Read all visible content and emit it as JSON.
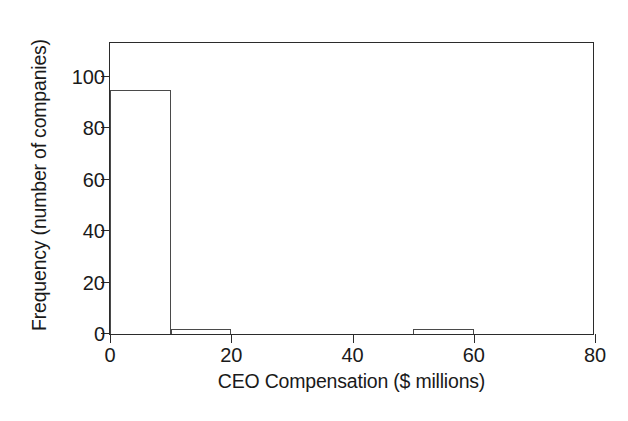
{
  "chart_data": {
    "type": "bar",
    "chart_subtype": "histogram",
    "title": "",
    "xlabel": "CEO Compensation ($ millions)",
    "ylabel": "Frequency (number of companies)",
    "xlim": [
      0,
      80
    ],
    "ylim": [
      0,
      114
    ],
    "xticks": [
      0,
      20,
      40,
      60,
      80
    ],
    "xtick_labels": [
      "0",
      "20",
      "40",
      "60",
      "80"
    ],
    "yticks": [
      0,
      20,
      40,
      60,
      80,
      100
    ],
    "ytick_labels": [
      "0",
      "20",
      "40",
      "60",
      "80",
      "100"
    ],
    "grid": false,
    "legend": null,
    "bin_width": 10,
    "bin_edges": [
      0,
      10,
      20,
      30,
      40,
      50,
      60,
      70,
      80
    ],
    "categories": [
      "0-10",
      "10-20",
      "20-30",
      "30-40",
      "40-50",
      "50-60",
      "60-70",
      "70-80"
    ],
    "values": [
      95,
      2,
      0,
      0,
      0,
      2,
      0,
      0
    ],
    "bars": [
      {
        "label": "0-10",
        "x0": 0,
        "x1": 10,
        "value": 95
      },
      {
        "label": "10-20",
        "x0": 10,
        "x1": 20,
        "value": 2
      },
      {
        "label": "20-30",
        "x0": 20,
        "x1": 30,
        "value": 0
      },
      {
        "label": "30-40",
        "x0": 30,
        "x1": 40,
        "value": 0
      },
      {
        "label": "40-50",
        "x0": 40,
        "x1": 50,
        "value": 0
      },
      {
        "label": "50-60",
        "x0": 50,
        "x1": 60,
        "value": 2
      },
      {
        "label": "60-70",
        "x0": 60,
        "x1": 70,
        "value": 0
      },
      {
        "label": "70-80",
        "x0": 70,
        "x1": 80,
        "value": 0
      }
    ],
    "colors": {
      "background": "#ffffff",
      "axis": "#2b2b2b",
      "bar_fill": "#ffffff",
      "bar_edge": "#4a4a4a",
      "text": "#1a1a1a"
    }
  }
}
